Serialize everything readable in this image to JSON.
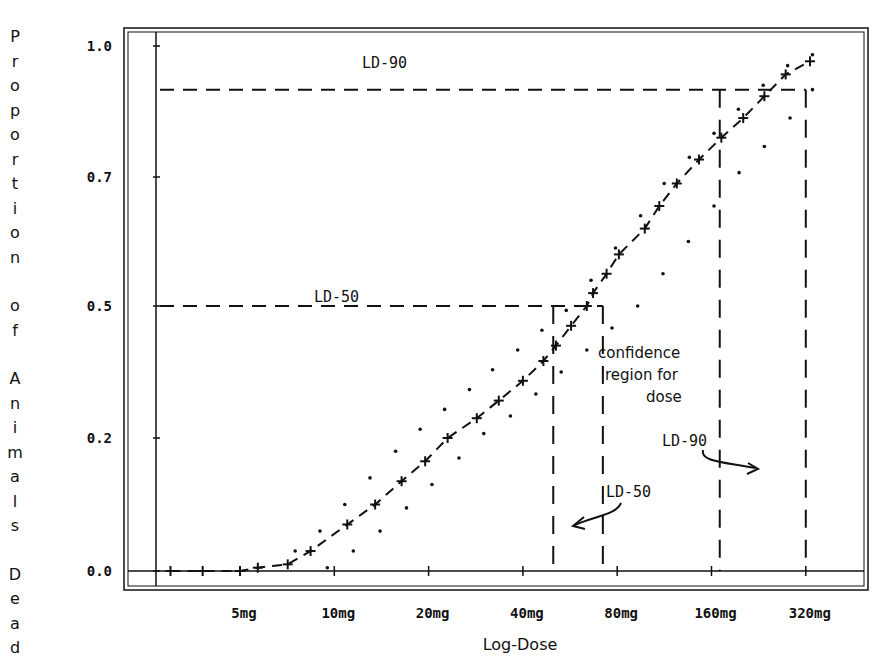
{
  "chart_data": {
    "type": "line",
    "title": "",
    "xlabel": "Log-Dose",
    "ylabel": "Proportion of Animals Dead",
    "x_scale": "log2",
    "x_ticks": [
      {
        "value": 5,
        "label": "5mg"
      },
      {
        "value": 10,
        "label": "10mg"
      },
      {
        "value": 20,
        "label": "20mg"
      },
      {
        "value": 40,
        "label": "40mg"
      },
      {
        "value": 80,
        "label": "80mg"
      },
      {
        "value": 160,
        "label": "160mg"
      },
      {
        "value": 320,
        "label": "320mg"
      }
    ],
    "y_ticks": [
      {
        "value": 0.0,
        "label": "0.0"
      },
      {
        "value": 0.2,
        "label": "0.2"
      },
      {
        "value": 0.5,
        "label": "0.5"
      },
      {
        "value": 0.7,
        "label": "0.7"
      },
      {
        "value": 1.0,
        "label": "1.0"
      }
    ],
    "ylim": [
      0.0,
      1.0
    ],
    "grid": false,
    "series": [
      {
        "name": "fitted dose-response",
        "style": "dashed with plus markers",
        "x": [
          3.0,
          3.8,
          5.0,
          5.7,
          7.1,
          8.4,
          11.0,
          13.5,
          16.4,
          19.5,
          23.0,
          28.5,
          33.5,
          40.0,
          46.5,
          51.0,
          57.0,
          64.0,
          67.0,
          74.0,
          81.0,
          98.0,
          109.0,
          124.0,
          146.0,
          172.0,
          202.0,
          236.0,
          276.0,
          330.0
        ],
        "y": [
          0.0,
          0.0,
          0.0,
          0.005,
          0.01,
          0.03,
          0.07,
          0.1,
          0.135,
          0.165,
          0.2,
          0.245,
          0.285,
          0.33,
          0.375,
          0.41,
          0.455,
          0.5,
          0.52,
          0.55,
          0.58,
          0.62,
          0.655,
          0.69,
          0.74,
          0.79,
          0.835,
          0.885,
          0.935,
          0.965
        ]
      },
      {
        "name": "upper confidence band",
        "style": "dotted",
        "x": [
          7.5,
          9.0,
          10.8,
          13.0,
          15.7,
          18.8,
          22.5,
          27.0,
          32.0,
          38.5,
          46.0,
          55.0,
          66.0,
          79.0,
          95.0,
          113.0,
          136.0,
          163.0,
          195.0,
          234.0,
          280.0,
          336.0
        ],
        "y": [
          0.03,
          0.06,
          0.1,
          0.14,
          0.18,
          0.22,
          0.265,
          0.31,
          0.355,
          0.4,
          0.445,
          0.49,
          0.54,
          0.59,
          0.64,
          0.69,
          0.745,
          0.8,
          0.855,
          0.91,
          0.955,
          0.98
        ]
      },
      {
        "name": "lower confidence band",
        "style": "dotted",
        "x": [
          9.5,
          11.5,
          14.0,
          17.0,
          20.5,
          25.0,
          30.0,
          36.5,
          44.0,
          53.0,
          64.0,
          77.0,
          93.0,
          112.0,
          135.0,
          163.0,
          196.0,
          236.0,
          285.0,
          336.0
        ],
        "y": [
          0.005,
          0.03,
          0.06,
          0.095,
          0.13,
          0.17,
          0.21,
          0.25,
          0.3,
          0.35,
          0.4,
          0.45,
          0.5,
          0.55,
          0.6,
          0.655,
          0.71,
          0.77,
          0.835,
          0.9
        ]
      }
    ],
    "annotations": {
      "ld50": {
        "label": "LD-50",
        "y": 0.5,
        "dose_lower": 50,
        "dose_upper": 72
      },
      "ld90": {
        "label": "LD-90",
        "y": 0.9,
        "dose_lower": 170,
        "dose_upper": 320
      },
      "ld50_arrow_label": "LD-50",
      "ld90_arrow_label": "LD-90",
      "confidence_note": [
        "confidence",
        "region for",
        "dose"
      ]
    }
  }
}
